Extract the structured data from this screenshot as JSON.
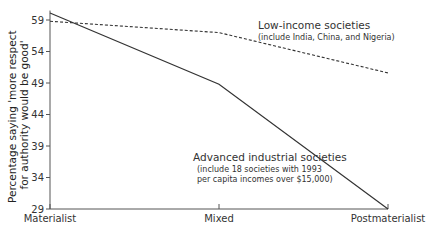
{
  "chart_data": {
    "type": "line",
    "title": "",
    "xlabel": "",
    "ylabel": [
      "Percentage saying 'more respect",
      "for authority would be good'"
    ],
    "categories": [
      "Materialist",
      "Mixed",
      "Postmaterialist"
    ],
    "yticks": [
      29,
      34,
      39,
      44,
      49,
      54,
      59
    ],
    "ylim": [
      29,
      60.5
    ],
    "grid": false,
    "series": [
      {
        "name": "Advanced industrial societies",
        "style": "solid",
        "values": [
          60.1,
          48.8,
          29
        ],
        "annotation": {
          "title": "Advanced industrial societies",
          "lines": [
            "(include 18 societies with 1993",
            "per capita incomes over $15,000)"
          ]
        }
      },
      {
        "name": "Low-income societies",
        "style": "dashed",
        "values": [
          58.8,
          57.0,
          50.6
        ],
        "annotation": {
          "title": "Low-income societies",
          "lines": [
            "(include India, China, and Nigeria)"
          ]
        }
      }
    ]
  }
}
